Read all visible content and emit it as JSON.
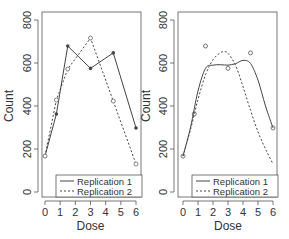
{
  "chart_data": [
    {
      "type": "line",
      "title": "",
      "xlabel": "Dose",
      "ylabel": "Count",
      "xlim": [
        -0.2,
        6.2
      ],
      "ylim": [
        -30,
        830
      ],
      "xticks": [
        0,
        1,
        2,
        3,
        4,
        5,
        6
      ],
      "yticks": [
        0,
        200,
        400,
        600,
        800
      ],
      "grid": false,
      "legend_position": "bottom-center",
      "series": [
        {
          "name": "Replication 1",
          "style": "solid",
          "marker": "filled-circle",
          "x": [
            0,
            0.75,
            1.5,
            3,
            4.5,
            6
          ],
          "values": [
            167,
            363,
            679,
            575,
            647,
            298
          ]
        },
        {
          "name": "Replication 2",
          "style": "dashed",
          "marker": "open-circle",
          "x": [
            0,
            0.75,
            1.5,
            3,
            4.5,
            6
          ],
          "values": [
            167,
            428,
            572,
            716,
            423,
            130
          ]
        }
      ]
    },
    {
      "type": "line",
      "title": "",
      "xlabel": "Dose",
      "ylabel": "Count",
      "xlim": [
        -0.2,
        6.2
      ],
      "ylim": [
        -30,
        830
      ],
      "xticks": [
        0,
        1,
        2,
        3,
        4,
        5,
        6
      ],
      "yticks": [
        0,
        200,
        400,
        600,
        800
      ],
      "grid": false,
      "legend_position": "bottom-center",
      "points": {
        "x": [
          0,
          0.75,
          1.5,
          3,
          4.5,
          6
        ],
        "values": [
          167,
          363,
          679,
          575,
          647,
          298
        ],
        "marker": "open-circle"
      },
      "series": [
        {
          "name": "Replication 1",
          "style": "solid",
          "smooth": true,
          "x": [
            0,
            0.5,
            1,
            1.5,
            2,
            2.5,
            3,
            3.5,
            4,
            4.5,
            5,
            5.5,
            6
          ],
          "values": [
            167,
            300,
            470,
            575,
            590,
            592,
            590,
            597,
            612,
            598,
            520,
            400,
            298
          ]
        },
        {
          "name": "Replication 2",
          "style": "dashed",
          "smooth": true,
          "x": [
            0,
            0.5,
            1,
            1.5,
            2,
            2.5,
            2.8,
            3,
            3.5,
            4,
            4.5,
            5,
            5.5,
            6
          ],
          "values": [
            167,
            290,
            430,
            545,
            615,
            648,
            652,
            645,
            590,
            490,
            380,
            280,
            200,
            130
          ]
        }
      ]
    }
  ]
}
